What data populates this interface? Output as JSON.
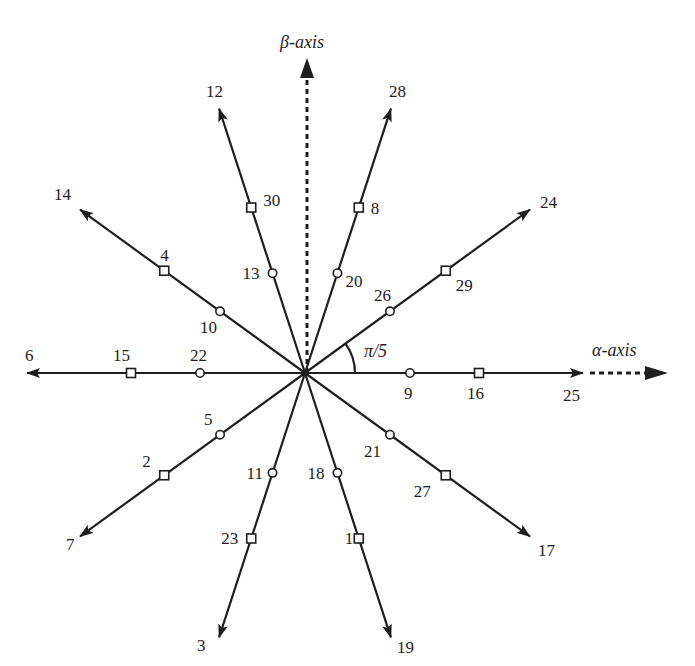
{
  "diagram": {
    "type": "space-vector-diagram",
    "center": [
      305,
      373
    ],
    "ray_length": 278,
    "circle_radius_pos": 105,
    "square_radius_pos": 174,
    "angle_label": "π/5",
    "alpha_axis_label": "α-axis",
    "beta_axis_label": "β-axis",
    "colors": {
      "stroke": "#1e1e1e",
      "background": "#ffffff"
    },
    "rays": [
      {
        "angle_deg": 0,
        "tip_label": "25",
        "circle_label": "9",
        "square_label": "16"
      },
      {
        "angle_deg": 36,
        "tip_label": "24",
        "circle_label": "26",
        "square_label": "29"
      },
      {
        "angle_deg": 72,
        "tip_label": "28",
        "circle_label": "20",
        "square_label": "8"
      },
      {
        "angle_deg": 108,
        "tip_label": "12",
        "circle_label": "13",
        "square_label": "30"
      },
      {
        "angle_deg": 144,
        "tip_label": "14",
        "circle_label": "10",
        "square_label": "4"
      },
      {
        "angle_deg": 180,
        "tip_label": "6",
        "circle_label": "22",
        "square_label": "15"
      },
      {
        "angle_deg": 216,
        "tip_label": "7",
        "circle_label": "5",
        "square_label": "2"
      },
      {
        "angle_deg": 252,
        "tip_label": "3",
        "circle_label": "11",
        "square_label": "23"
      },
      {
        "angle_deg": 288,
        "tip_label": "19",
        "circle_label": "18",
        "square_label": "1"
      },
      {
        "angle_deg": 324,
        "tip_label": "17",
        "circle_label": "21",
        "square_label": "27"
      }
    ],
    "legend": {
      "circle_marker": "inner-vector",
      "square_marker": "middle-vector",
      "arrow_tip": "outer-vector"
    }
  }
}
